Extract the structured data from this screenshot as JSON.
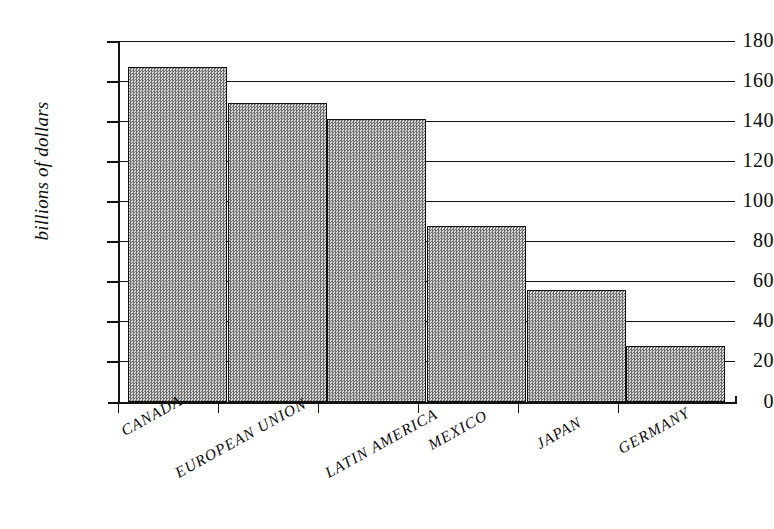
{
  "chart_data": {
    "type": "bar",
    "title": "",
    "subtitle": "",
    "xlabel": "",
    "ylabel": "billions of dollars",
    "categories": [
      "CANADA",
      "EUROPEAN UNION",
      "LATIN AMERICA",
      "MEXICO",
      "JAPAN",
      "GERMANY"
    ],
    "values": [
      167,
      149,
      141,
      88,
      56,
      28
    ],
    "series": [
      {
        "name": "",
        "values": [
          167,
          149,
          141,
          88,
          56,
          28
        ]
      }
    ],
    "ylim": [
      0,
      180
    ],
    "ytick_labels": [
      "180",
      "160",
      "140",
      "120",
      "100",
      "80",
      "60",
      "40",
      "20",
      "0"
    ],
    "ytick_values": [
      180,
      160,
      140,
      120,
      100,
      80,
      60,
      40,
      20,
      0
    ],
    "ytick_step": 20,
    "grid": "horizontal",
    "legend": "none",
    "bar_fill_color": "#a8a8a8",
    "bar_edge_color": "#14110e",
    "axis_color": "#15120f",
    "background_color": "#ffffff",
    "annotations": []
  },
  "axes": {
    "y_title": "billions of dollars"
  }
}
